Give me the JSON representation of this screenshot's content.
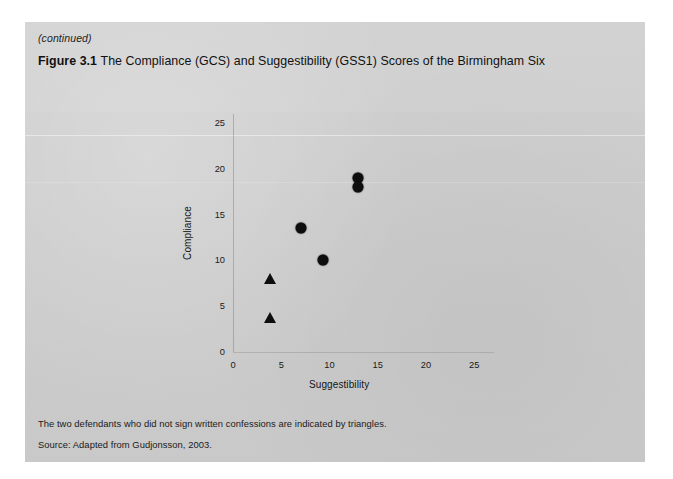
{
  "page": {
    "continued_note": "(continued)",
    "figure_label": "Figure 3.1",
    "figure_title": "The Compliance (GCS) and Suggestibility (GSS1) Scores of the Birmingham Six",
    "footnote": "The two defendants who did not sign written confessions are indicated by triangles.",
    "source": "Source: Adapted from Gudjonsson, 2003."
  },
  "chart_data": {
    "type": "scatter",
    "title": "The Compliance (GCS) and Suggestibility (GSS1) Scores of the Birmingham Six",
    "xlabel": "Suggestibility",
    "ylabel": "Compliance",
    "xlim": [
      0,
      27
    ],
    "ylim": [
      0,
      26
    ],
    "xticks": [
      0,
      5,
      10,
      15,
      20,
      25
    ],
    "yticks": [
      0,
      5,
      10,
      15,
      20,
      25
    ],
    "grid": false,
    "legend": "none",
    "series": [
      {
        "name": "Signed written confession",
        "marker": "circle",
        "color": "#0d0d0d",
        "points": [
          {
            "x": 13.0,
            "y": 19.0
          },
          {
            "x": 13.0,
            "y": 18.0
          },
          {
            "x": 7.0,
            "y": 13.5
          },
          {
            "x": 9.3,
            "y": 10.0
          }
        ]
      },
      {
        "name": "Did not sign written confession",
        "marker": "triangle",
        "color": "#0d0d0d",
        "points": [
          {
            "x": 3.8,
            "y": 8.0
          },
          {
            "x": 3.8,
            "y": 3.7
          }
        ]
      }
    ],
    "annotation": "The two defendants who did not sign written confessions are indicated by triangles.",
    "source": "Adapted from Gudjonsson, 2003."
  },
  "colors": {
    "panel_background": "#cdcdcd",
    "page_background": "#ffffff",
    "marker": "#0d0d0d",
    "text": "#1a1a1a"
  }
}
